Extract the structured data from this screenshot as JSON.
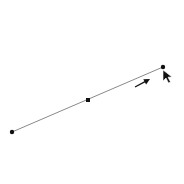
{
  "colors": {
    "background": "#ffffff",
    "line": "#8a8a8a",
    "point": "#111111",
    "arrow": "#111111",
    "edge_text": "#555555"
  },
  "segment": {
    "start": {
      "x": 12,
      "y": 132
    },
    "mid": {
      "x": 88,
      "y": 100
    },
    "end": {
      "x": 163,
      "y": 67
    }
  },
  "direction_arrow": {
    "from": {
      "x": 135,
      "y": 87
    },
    "to": {
      "x": 150,
      "y": 79
    }
  },
  "cursor": {
    "x": 163,
    "y": 70,
    "icon": "mouse-pointer-icon"
  },
  "edge_text_fragments": [
    "·",
    "",
    "",
    "",
    "-",
    "",
    "·",
    "",
    "'",
    "",
    "|",
    "",
    "",
    "|",
    "",
    "",
    "·",
    "",
    "'",
    "",
    "|",
    "",
    "'",
    "",
    "'",
    "",
    "-",
    "",
    "'",
    "",
    "t",
    "",
    "'",
    "",
    "·",
    "f"
  ]
}
